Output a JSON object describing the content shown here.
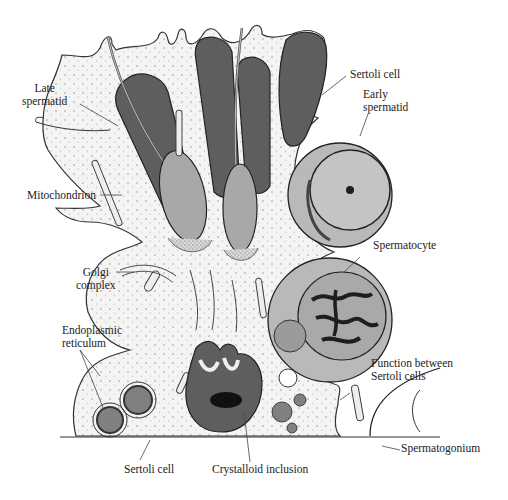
{
  "figure": {
    "colors": {
      "background": "#ffffff",
      "cytoplasm": "#f4f4f2",
      "outline": "#333333",
      "nucleus_dark": "#5e5e5e",
      "acrosome_gray": "#a8a8a8",
      "round_cell_gray": "#b9b9b9",
      "chromatin": "#1e1e1e",
      "leader_line": "#444444"
    }
  },
  "labels": {
    "late_spermatid": [
      "Late",
      "spermatid"
    ],
    "sertoli_cell_top": "Sertoli cell",
    "early_spermatid": [
      "Early",
      "spermatid"
    ],
    "mitochondrion": "Mitochondrion",
    "golgi_complex": [
      "Golgi",
      "complex"
    ],
    "spermatocyte": "Spermatocyte",
    "endoplasmic_reticulum": [
      "Endoplasmic",
      "reticulum"
    ],
    "function_between": [
      "Function between",
      "Sertoli cells"
    ],
    "spermatogonium": "Spermatogonium",
    "sertoli_cell_bottom": "Sertoli cell",
    "crystalloid_inclusion": "Crystalloid inclusion"
  }
}
